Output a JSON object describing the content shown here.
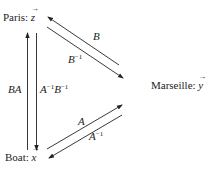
{
  "nodes": {
    "paris": {
      "name": "Paris:",
      "vector": "z"
    },
    "marseille": {
      "name": "Marseille:",
      "vector": "y"
    },
    "boat": {
      "name": "Boat:",
      "vector": "x"
    }
  },
  "edges": {
    "marseille_to_paris": {
      "base": "B",
      "exp": ""
    },
    "paris_to_marseille": {
      "base": "B",
      "exp": "−1"
    },
    "boat_to_marseille": {
      "base": "A",
      "exp": ""
    },
    "marseille_to_boat": {
      "base": "A",
      "exp": "−1"
    },
    "boat_to_paris": {
      "base": "BA",
      "exp": ""
    },
    "paris_to_boat": {
      "base1": "A",
      "exp1": "−1",
      "base2": "B",
      "exp2": "−1"
    }
  },
  "colors": {
    "line": "#222222",
    "background": "#ffffff"
  }
}
